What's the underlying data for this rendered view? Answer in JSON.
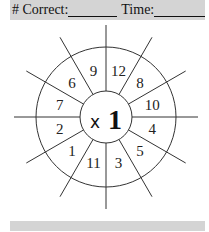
{
  "header": {
    "correct_label": "# Correct:",
    "time_label": "Time:"
  },
  "wheel": {
    "operator": "x",
    "factor": "1",
    "numbers": [
      {
        "label": "12",
        "angle": 75
      },
      {
        "label": "8",
        "angle": 45
      },
      {
        "label": "10",
        "angle": 15
      },
      {
        "label": "4",
        "angle": -15
      },
      {
        "label": "5",
        "angle": -45
      },
      {
        "label": "3",
        "angle": -75
      },
      {
        "label": "11",
        "angle": -105
      },
      {
        "label": "1",
        "angle": -135
      },
      {
        "label": "2",
        "angle": -165
      },
      {
        "label": "7",
        "angle": 165
      },
      {
        "label": "6",
        "angle": 135
      },
      {
        "label": "9",
        "angle": 105
      }
    ]
  },
  "colors": {
    "band": "#d4d4d4",
    "ink": "#222222"
  }
}
